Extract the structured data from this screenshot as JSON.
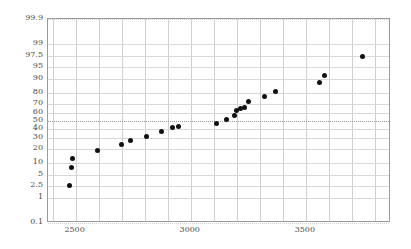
{
  "chart_data": {
    "type": "scatter",
    "title": "",
    "subtitle": "",
    "xlabel": "",
    "ylabel": "",
    "plot_kind": "normal-probability-plot",
    "grid": true,
    "legend": null,
    "xlim": [
      2380,
      3870
    ],
    "ylim_percent": [
      0.1,
      99.9
    ],
    "y_scale": "normal-probability",
    "y_tick_labels": [
      "99.9",
      "99",
      "97.5",
      "95",
      "90",
      "80",
      "70",
      "60",
      "50",
      "40",
      "30",
      "20",
      "10",
      "5",
      "2.5",
      "1",
      "0.1"
    ],
    "y_tick_values": [
      99.9,
      99,
      97.5,
      95,
      90,
      80,
      70,
      60,
      50,
      40,
      30,
      20,
      10,
      5,
      2.5,
      1,
      0.1
    ],
    "x_tick_labels": [
      "2500",
      "3000",
      "3500"
    ],
    "x_tick_values": [
      2500,
      3000,
      3500
    ],
    "x_minor_gridlines": [
      2400,
      2500,
      2600,
      2700,
      2800,
      2900,
      3000,
      3100,
      3200,
      3300,
      3400,
      3500,
      3600,
      3700,
      3800
    ],
    "reference_line_percent": 50,
    "x": [
      2474,
      2480,
      2487,
      2594,
      2700,
      2740,
      2810,
      2875,
      2920,
      2945,
      3114,
      3155,
      3190,
      3210,
      3230,
      3242,
      3258,
      3285,
      3330,
      3370,
      3532,
      3552,
      3730
    ],
    "y_percent": [
      2.5,
      8,
      13,
      18.5,
      23.5,
      27.5,
      32,
      37.5,
      42,
      43.5,
      47,
      52,
      57,
      62,
      64.5,
      66,
      72,
      77,
      81.5,
      88,
      91.5,
      97.5,
      97.5
    ],
    "points": [
      {
        "x": 2474,
        "y_percent": 2.5
      },
      {
        "x": 2480,
        "y_percent": 8
      },
      {
        "x": 2487,
        "y_percent": 13
      },
      {
        "x": 2594,
        "y_percent": 18.5
      },
      {
        "x": 2700,
        "y_percent": 23.5
      },
      {
        "x": 2740,
        "y_percent": 27.5
      },
      {
        "x": 2810,
        "y_percent": 32
      },
      {
        "x": 2875,
        "y_percent": 37.5
      },
      {
        "x": 2920,
        "y_percent": 42
      },
      {
        "x": 2945,
        "y_percent": 43.5
      },
      {
        "x": 3114,
        "y_percent": 47
      },
      {
        "x": 3155,
        "y_percent": 52
      },
      {
        "x": 3190,
        "y_percent": 57
      },
      {
        "x": 3200,
        "y_percent": 62
      },
      {
        "x": 3215,
        "y_percent": 64.5
      },
      {
        "x": 3235,
        "y_percent": 66
      },
      {
        "x": 3250,
        "y_percent": 72
      },
      {
        "x": 3320,
        "y_percent": 77
      },
      {
        "x": 3370,
        "y_percent": 81.5
      },
      {
        "x": 3560,
        "y_percent": 88
      },
      {
        "x": 3580,
        "y_percent": 91.5
      },
      {
        "x": 3745,
        "y_percent": 97.5
      }
    ],
    "colors": {
      "point": "#111111",
      "grid": "#cfcfcf",
      "axis": "#9a9a9a",
      "label": "#4a4a4a",
      "background": "#ffffff"
    }
  }
}
